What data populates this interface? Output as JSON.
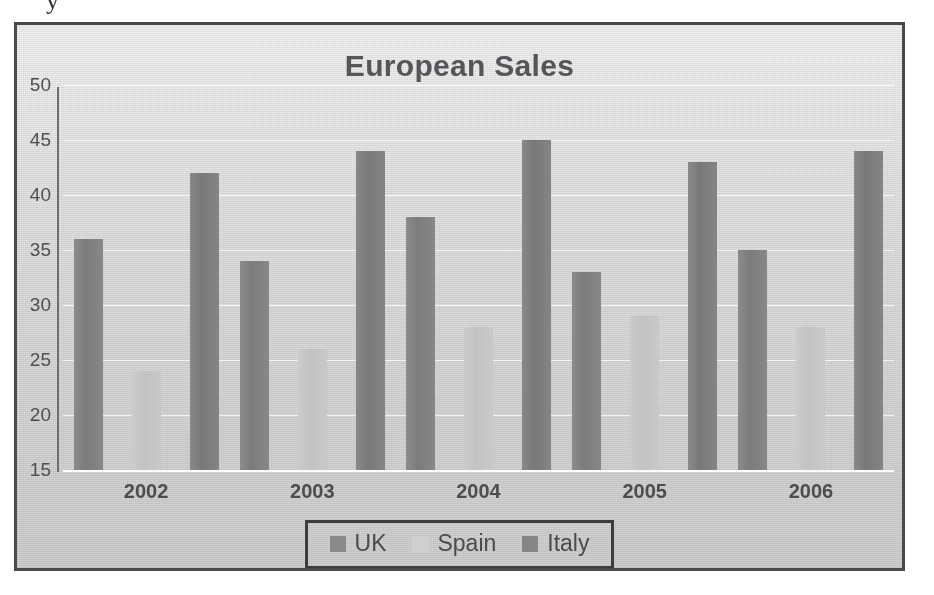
{
  "artifact": {
    "glyph": "y"
  },
  "chart_data": {
    "type": "bar",
    "title": "European Sales",
    "xlabel": "",
    "ylabel": "",
    "categories": [
      "2002",
      "2003",
      "2004",
      "2005",
      "2006"
    ],
    "series": [
      {
        "name": "UK",
        "color": "#8a8a8a",
        "values": [
          36,
          34,
          38,
          33,
          35
        ]
      },
      {
        "name": "Spain",
        "color": "#cfcfcf",
        "values": [
          24,
          26,
          28,
          29,
          28
        ]
      },
      {
        "name": "Italy",
        "color": "#868686",
        "values": [
          42,
          44,
          45,
          43,
          44
        ]
      }
    ],
    "ylim": [
      15,
      50
    ],
    "yticks": [
      15,
      20,
      25,
      30,
      35,
      40,
      45,
      50
    ],
    "ytick_labels": [
      "15",
      "20",
      "25",
      "30",
      "35",
      "40",
      "45",
      "50"
    ],
    "grid": true,
    "legend_position": "bottom",
    "legend_entries": [
      "UK",
      "Spain",
      "Italy"
    ]
  },
  "style": {
    "frame_border_color": "#4a4a4a",
    "legend_border_color": "#3d3d3d",
    "text_color": "#4c4d50",
    "title_color": "#55565a",
    "gridline_color": "#ffffff",
    "background_top": "#f3f3f3",
    "background_bottom": "#d1d1d1"
  }
}
